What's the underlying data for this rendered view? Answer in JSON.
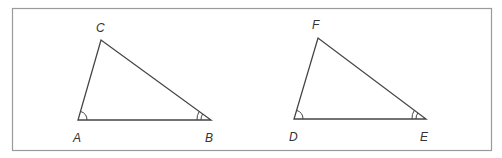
{
  "diagram": {
    "frame": {
      "x": 12,
      "y": 8,
      "width": 479,
      "height": 142,
      "stroke": "#9a9a9a"
    },
    "line_color": "#444444",
    "triangles": [
      {
        "name": "ABC",
        "vertices": [
          {
            "label": "A",
            "x": 78,
            "y": 120,
            "label_x": 73,
            "label_y": 142,
            "angle_marks": 1
          },
          {
            "label": "B",
            "x": 211,
            "y": 120,
            "label_x": 205,
            "label_y": 142,
            "angle_marks": 2
          },
          {
            "label": "C",
            "x": 101,
            "y": 40,
            "label_x": 96,
            "label_y": 32,
            "angle_marks": 0
          }
        ]
      },
      {
        "name": "DEF",
        "vertices": [
          {
            "label": "D",
            "x": 294,
            "y": 119,
            "label_x": 289,
            "label_y": 141,
            "angle_marks": 1
          },
          {
            "label": "E",
            "x": 426,
            "y": 119,
            "label_x": 420,
            "label_y": 141,
            "angle_marks": 2
          },
          {
            "label": "F",
            "x": 318,
            "y": 38,
            "label_x": 312,
            "label_y": 29,
            "angle_marks": 0
          }
        ]
      }
    ]
  }
}
